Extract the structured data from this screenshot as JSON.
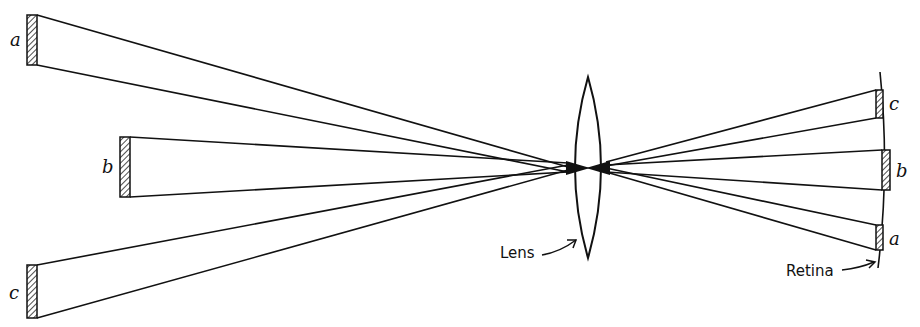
{
  "diagram": {
    "objects": [
      {
        "label": "a",
        "x": 27,
        "y_top": 15,
        "y_bottom": 65
      },
      {
        "label": "b",
        "x": 120,
        "y_top": 137,
        "y_bottom": 197
      },
      {
        "label": "c",
        "x": 27,
        "y_top": 265,
        "y_bottom": 318
      }
    ],
    "images": [
      {
        "label": "c",
        "x": 878,
        "y_top": 90,
        "y_bottom": 118
      },
      {
        "label": "b",
        "x": 884,
        "y_top": 150,
        "y_bottom": 190
      },
      {
        "label": "a",
        "x": 878,
        "y_top": 225,
        "y_bottom": 250
      }
    ],
    "lens": {
      "label": "Lens",
      "cx": 588,
      "top": 77,
      "bottom": 258,
      "half_width": 22,
      "center_y": 168
    },
    "retina": {
      "label": "Retina"
    },
    "colors": {
      "line": "#111111",
      "background": "#ffffff"
    }
  }
}
